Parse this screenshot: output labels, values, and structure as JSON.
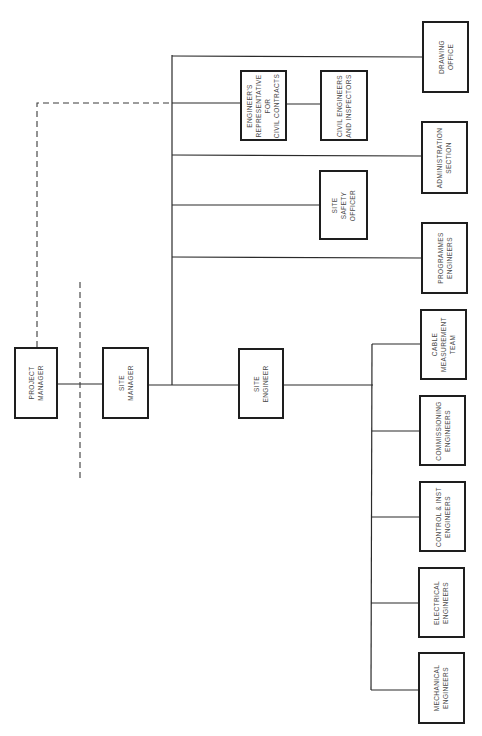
{
  "diagram": {
    "type": "organization-chart",
    "orientation": "rotated-90-ccw",
    "colors": {
      "line": "#2a2a2a",
      "box_border": "#1e1e1e",
      "text": "#4a4a4a",
      "background": "#ffffff"
    },
    "nodes": {
      "project_manager": {
        "label": "PROJECT\nMANAGER",
        "box": [
          14,
          347,
          44,
          72
        ]
      },
      "site_manager": {
        "label": "SITE\nMANAGER",
        "box": [
          102,
          347,
          47,
          72
        ]
      },
      "site_engineer": {
        "label": "SITE\nENGINEER",
        "box": [
          238,
          348,
          46,
          71
        ]
      },
      "engineers_representative": {
        "label": "ENGINEER'S\nREPRESENTATIVE\nFOR\nCIVIL CONTRACTS",
        "box": [
          240,
          70,
          47,
          71
        ]
      },
      "civil_engineers": {
        "label": "CIVIL ENGINEERS\nAND INSPECTORS",
        "box": [
          320,
          70,
          48,
          71
        ]
      },
      "site_safety_officer": {
        "label": "SITE\nSAFETY\nOFFICER",
        "box": [
          319,
          170,
          49,
          70
        ]
      },
      "drawing_office": {
        "label": "DRAWING\nOFFICE",
        "box": [
          422,
          21,
          47,
          72
        ]
      },
      "administration_section": {
        "label": "ADMINISTRATION\nSECTION",
        "box": [
          421,
          121,
          47,
          73
        ]
      },
      "programmes_engineers": {
        "label": "PROGRAMMES\nENGINEERS",
        "box": [
          421,
          222,
          47,
          72
        ]
      },
      "cable_measurement_team": {
        "label": "CABLE\nMEASUREMENT\nTEAM",
        "box": [
          420,
          309,
          47,
          71
        ]
      },
      "commissioning_engineers": {
        "label": "COMMISSIONING\nENGINEERS",
        "box": [
          419,
          395,
          47,
          71
        ]
      },
      "control_inst_engineers": {
        "label": "CONTROL & INST\nENGINEERS",
        "box": [
          419,
          481,
          47,
          71
        ]
      },
      "electrical_engineers": {
        "label": "ELECTRICAL\nENGINEERS",
        "box": [
          418,
          567,
          47,
          71
        ]
      },
      "mechanical_engineers": {
        "label": "MECHANICAL\nENGINEERS",
        "box": [
          418,
          652,
          47,
          72
        ]
      }
    },
    "edges": [
      {
        "from": "project_manager",
        "to": "site_manager",
        "style": "solid"
      },
      {
        "from": "site_manager",
        "to": "site_engineer",
        "style": "solid"
      },
      {
        "from": "site_manager",
        "to": "drawing_office",
        "style": "solid"
      },
      {
        "from": "site_manager",
        "to": "engineers_representative",
        "style": "solid"
      },
      {
        "from": "engineers_representative",
        "to": "civil_engineers",
        "style": "solid"
      },
      {
        "from": "site_manager",
        "to": "administration_section",
        "style": "solid"
      },
      {
        "from": "site_manager",
        "to": "site_safety_officer",
        "style": "solid"
      },
      {
        "from": "site_manager",
        "to": "programmes_engineers",
        "style": "solid"
      },
      {
        "from": "site_engineer",
        "to": "cable_measurement_team",
        "style": "solid"
      },
      {
        "from": "site_engineer",
        "to": "commissioning_engineers",
        "style": "solid"
      },
      {
        "from": "site_engineer",
        "to": "control_inst_engineers",
        "style": "solid"
      },
      {
        "from": "site_engineer",
        "to": "electrical_engineers",
        "style": "solid"
      },
      {
        "from": "site_engineer",
        "to": "mechanical_engineers",
        "style": "solid"
      },
      {
        "from": "project_manager",
        "to": "engineers_representative",
        "style": "dashed"
      }
    ],
    "divider": {
      "style": "dashed",
      "orientation": "vertical",
      "position": "between project manager and site manager"
    }
  }
}
